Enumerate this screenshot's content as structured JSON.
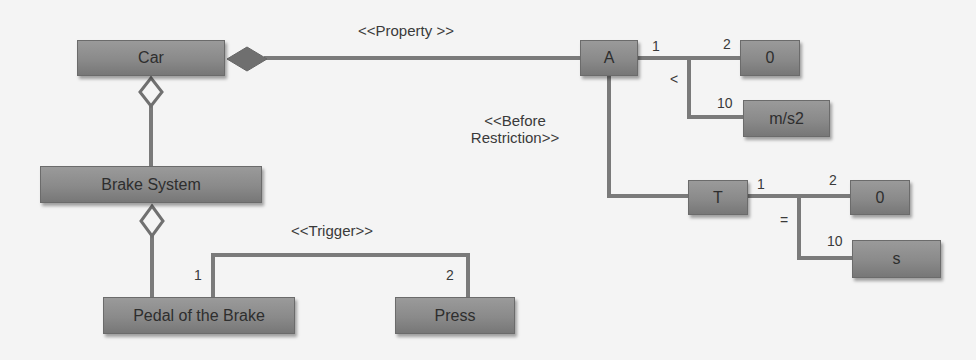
{
  "diagram": {
    "nodes": {
      "car": "Car",
      "brake_system": "Brake System",
      "pedal": "Pedal of the Brake",
      "press": "Press",
      "a": "A",
      "a_min": "0",
      "a_unit": "m/s2",
      "t": "T",
      "t_min": "0",
      "t_unit": "s"
    },
    "stereotypes": {
      "property": "<<Property >>",
      "before_line1": "<<Before",
      "before_line2": "Restriction>>",
      "trigger": "<<Trigger>>"
    },
    "multiplicities": {
      "a_side": "1",
      "a_value_side": "2",
      "a_unit_side": "10",
      "t_side": "1",
      "t_value_side": "2",
      "t_unit_side": "10",
      "pedal_side": "1",
      "press_side": "2"
    },
    "operators": {
      "a_operator": "<",
      "t_operator": "="
    },
    "colors": {
      "box_fill": "#8a8a8a",
      "line": "#7a7a7a",
      "background": "#f4f4f4"
    }
  }
}
